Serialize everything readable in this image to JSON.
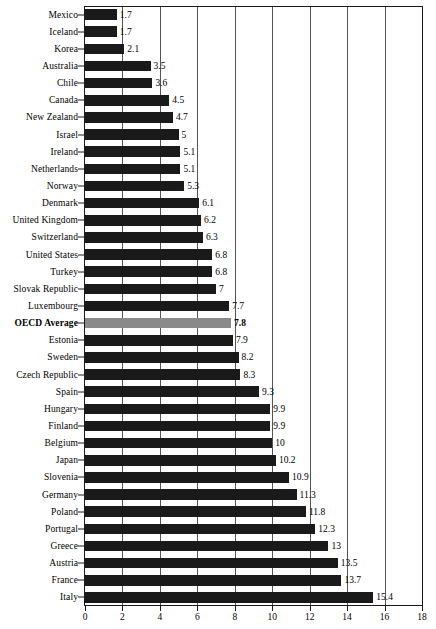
{
  "chart_data": {
    "type": "bar",
    "orientation": "horizontal",
    "title": "",
    "subtitle": "",
    "xlabel": "",
    "ylabel": "",
    "xlim": [
      0,
      18
    ],
    "xticks": [
      0,
      2,
      4,
      6,
      8,
      10,
      12,
      14,
      16,
      18
    ],
    "grid": true,
    "grid_axis": "x",
    "legend": false,
    "legend_position": "none",
    "colors": {
      "bar": "#1a1a1a",
      "highlight_bar": "#8a8a8a",
      "axis": "#1a1a1a",
      "gridline": "#555555",
      "text": "#000000",
      "background": "#ffffff"
    },
    "highlight_category": "OECD Average",
    "categories": [
      "Mexico",
      "Iceland",
      "Korea",
      "Australia",
      "Chile",
      "Canada",
      "New Zealand",
      "Israel",
      "Ireland",
      "Netherlands",
      "Norway",
      "Denmark",
      "United Kingdom",
      "Switzerland",
      "United States",
      "Turkey",
      "Slovak Republic",
      "Luxembourg",
      "OECD Average",
      "Estonia",
      "Sweden",
      "Czech Republic",
      "Spain",
      "Hungary",
      "Finland",
      "Belgium",
      "Japan",
      "Slovenia",
      "Germany",
      "Poland",
      "Portugal",
      "Greece",
      "Austria",
      "France",
      "Italy"
    ],
    "values": [
      1.7,
      1.7,
      2.1,
      3.5,
      3.6,
      4.5,
      4.7,
      5,
      5.1,
      5.1,
      5.3,
      6.1,
      6.2,
      6.3,
      6.8,
      6.8,
      7,
      7.7,
      7.8,
      7.9,
      8.2,
      8.3,
      9.3,
      9.9,
      9.9,
      10,
      10.2,
      10.9,
      11.3,
      11.8,
      12.3,
      13,
      13.5,
      13.7,
      15.4
    ],
    "value_labels": [
      "1.7",
      "1.7",
      "2.1",
      "3.5",
      "3.6",
      "4.5",
      "4.7",
      "5",
      "5.1",
      "5.1",
      "5.3",
      "6.1",
      "6.2",
      "6.3",
      "6.8",
      "6.8",
      "7",
      "7.7",
      "7.8",
      "7.9",
      "8.2",
      "8.3",
      "9.3",
      "9.9",
      "9.9",
      "10",
      "10.2",
      "10.9",
      "11.3",
      "11.8",
      "12.3",
      "13",
      "13.5",
      "13.7",
      "15.4"
    ]
  }
}
